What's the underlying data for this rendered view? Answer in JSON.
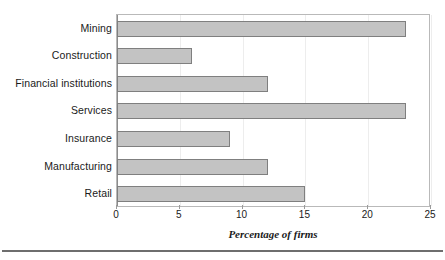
{
  "chart_data": {
    "type": "bar",
    "orientation": "horizontal",
    "title": "",
    "xlabel": "Percentage of firms",
    "ylabel": "",
    "categories": [
      "Mining",
      "Construction",
      "Financial institutions",
      "Services",
      "Insurance",
      "Manufacturing",
      "Retail"
    ],
    "values": [
      23,
      6,
      12,
      23,
      9,
      12,
      15
    ],
    "xlim": [
      0,
      25
    ],
    "xticks": [
      0,
      5,
      10,
      15,
      20,
      25
    ],
    "xtick_labels": [
      "0",
      "5",
      "10",
      "15",
      "20",
      "25"
    ],
    "grid": true,
    "grid_axis": "x",
    "legend": false,
    "bar_fill_color": "#c3c3c3",
    "bar_border_color": "#7f7f7f",
    "gridline_color": "#ededed",
    "axis_color": "#8c8c8c"
  }
}
